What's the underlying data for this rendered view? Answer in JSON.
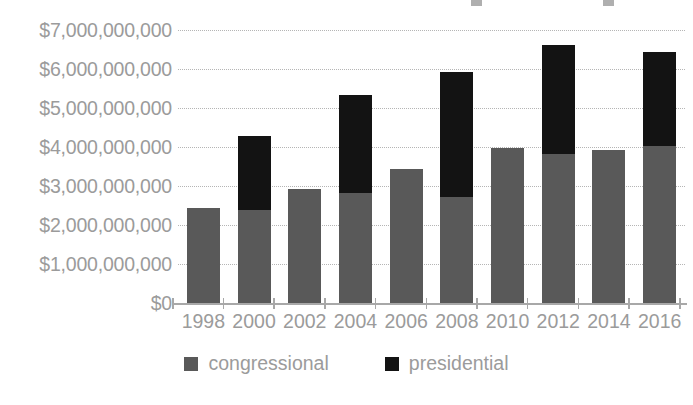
{
  "chart_data": {
    "type": "bar",
    "subtype": "stacked",
    "title": "",
    "xlabel": "",
    "ylabel": "",
    "categories": [
      "1998",
      "2000",
      "2002",
      "2004",
      "2006",
      "2008",
      "2010",
      "2012",
      "2014",
      "2016"
    ],
    "series": [
      {
        "name": "congressional",
        "color": "#595959",
        "values": [
          2450000000,
          2400000000,
          2950000000,
          2850000000,
          3450000000,
          2750000000,
          4000000000,
          3850000000,
          3950000000,
          4050000000
        ]
      },
      {
        "name": "presidential",
        "color": "#131313",
        "values": [
          0,
          1900000000,
          0,
          2500000000,
          0,
          3200000000,
          0,
          2800000000,
          0,
          2400000000
        ]
      }
    ],
    "totals": [
      2450000000,
      4300000000,
      2950000000,
      5350000000,
      3450000000,
      5950000000,
      4000000000,
      6650000000,
      3950000000,
      6450000000
    ],
    "ylim": [
      0,
      7000000000
    ],
    "ytick_values": [
      0,
      1000000000,
      2000000000,
      3000000000,
      4000000000,
      5000000000,
      6000000000,
      7000000000
    ],
    "ytick_labels": [
      "$0",
      "$1,000,000,000",
      "$2,000,000,000",
      "$3,000,000,000",
      "$4,000,000,000",
      "$5,000,000,000",
      "$6,000,000,000",
      "$7,000,000,000"
    ],
    "grid": true,
    "grid_style": "dotted",
    "grid_color": "#b5b5b5",
    "legend_position": "bottom",
    "legend": [
      {
        "label": "congressional",
        "color": "#595959"
      },
      {
        "label": "presidential",
        "color": "#131313"
      }
    ]
  },
  "axes": {
    "y_labels": [
      "$7,000,000,000",
      "$6,000,000,000",
      "$5,000,000,000",
      "$4,000,000,000",
      "$3,000,000,000",
      "$2,000,000,000",
      "$1,000,000,000",
      "$0"
    ],
    "x_labels": [
      "1998",
      "2000",
      "2002",
      "2004",
      "2006",
      "2008",
      "2010",
      "2012",
      "2014",
      "2016"
    ]
  },
  "legend": {
    "items": [
      {
        "label": "congressional",
        "swatch_name": "legend-swatch-congressional"
      },
      {
        "label": "presidential",
        "swatch_name": "legend-swatch-presidential"
      }
    ]
  },
  "colors": {
    "congressional": "#595959",
    "presidential": "#131313",
    "axis_text": "#9b9b9b",
    "gridline": "#b5b5b5",
    "background": "#ffffff"
  }
}
